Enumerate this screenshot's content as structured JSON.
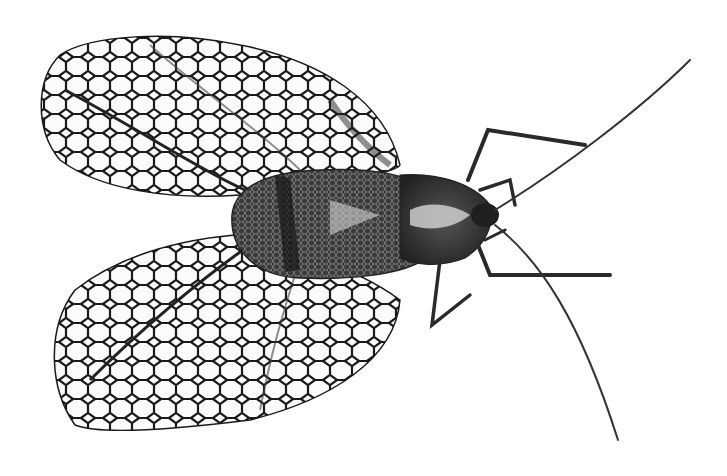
{
  "image": {
    "subject": "lace bug insect, dorsal view",
    "style": "black and white macro photograph",
    "background": "#ffffff",
    "colors": {
      "ink": "#1a1a1a",
      "mid": "#555555",
      "light": "#bdbdbd"
    }
  }
}
